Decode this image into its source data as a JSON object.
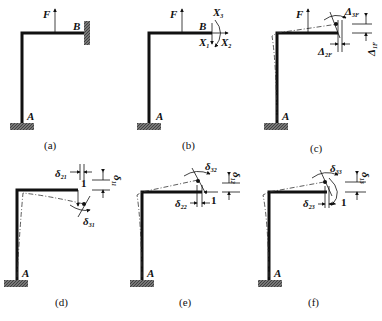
{
  "figure": {
    "panels": [
      {
        "id": "a",
        "caption": "(a)",
        "force": "F",
        "support_A": "A",
        "support_B": "B"
      },
      {
        "id": "b",
        "caption": "(b)",
        "force": "F",
        "point_A": "A",
        "point_B": "B",
        "unknowns": {
          "X1": "X",
          "X1_sub": "1",
          "X2": "X",
          "X2_sub": "2",
          "X3": "X",
          "X3_sub": "3"
        }
      },
      {
        "id": "c",
        "caption": "(c)",
        "force": "F",
        "point_A": "A",
        "displacements": {
          "d3": "Δ",
          "d3_sub": "3F",
          "d2": "Δ",
          "d2_sub": "2F",
          "d1": "Δ",
          "d1_sub": "1F"
        }
      },
      {
        "id": "d",
        "caption": "(d)",
        "point_A": "A",
        "unit_load": "1",
        "displacements": {
          "d21": "δ",
          "d21_sub": "21",
          "d11": "δ",
          "d11_sub": "11",
          "d31": "δ",
          "d31_sub": "31"
        }
      },
      {
        "id": "e",
        "caption": "(e)",
        "point_A": "A",
        "unit_load": "1",
        "displacements": {
          "d32": "δ",
          "d32_sub": "32",
          "d12": "δ",
          "d12_sub": "12",
          "d22": "δ",
          "d22_sub": "22"
        }
      },
      {
        "id": "f",
        "caption": "(f)",
        "point_A": "A",
        "unit_load": "1",
        "displacements": {
          "d33": "δ",
          "d33_sub": "33",
          "d13": "δ",
          "d13_sub": "13",
          "d23": "δ",
          "d23_sub": "23"
        }
      }
    ]
  }
}
